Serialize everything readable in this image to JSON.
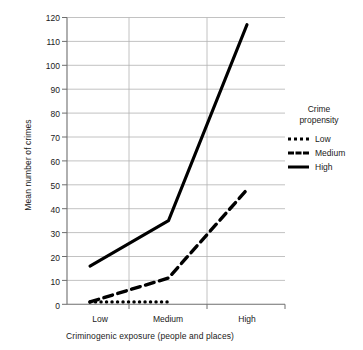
{
  "chart_data": {
    "type": "line",
    "title": "",
    "xlabel": "Criminogenic exposure (people and places)",
    "ylabel": "Mean number of crimes",
    "categories": [
      "Low",
      "Medium",
      "High"
    ],
    "ylim": [
      0,
      120
    ],
    "yticks": [
      0,
      10,
      20,
      30,
      40,
      50,
      60,
      70,
      80,
      90,
      100,
      110,
      120
    ],
    "grid": "horizontal-and-category-verticals",
    "legend": {
      "position": "right",
      "title_line1": "Crime",
      "title_line2": "propensity",
      "entries": [
        {
          "name": "Low",
          "style": "dotted"
        },
        {
          "name": "Medium",
          "style": "dashed"
        },
        {
          "name": "High",
          "style": "solid"
        }
      ]
    },
    "series": [
      {
        "name": "Low",
        "style": "dotted",
        "color": "#000000",
        "values": [
          1,
          1,
          null
        ]
      },
      {
        "name": "Medium",
        "style": "dashed",
        "color": "#000000",
        "values": [
          1,
          11,
          48
        ]
      },
      {
        "name": "High",
        "style": "solid",
        "color": "#000000",
        "values": [
          16,
          35,
          117
        ]
      }
    ]
  },
  "axes": {
    "y_tick_labels": [
      "120",
      "110",
      "100",
      "90",
      "80",
      "70",
      "60",
      "50",
      "40",
      "30",
      "20",
      "10",
      "0"
    ],
    "x_tick_labels": [
      "Low",
      "Medium",
      "High"
    ]
  },
  "colors": {
    "line": "#000000",
    "grid": "#b3b3b3",
    "axis": "#808080",
    "text": "#1a1a1a",
    "background": "#ffffff"
  }
}
